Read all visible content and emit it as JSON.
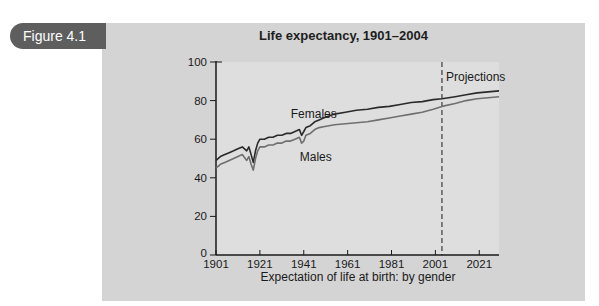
{
  "figure": {
    "label": "Figure 4.1",
    "colors": {
      "tab_bg": "#5e5e5e",
      "panel_bg": "#d4d4d4",
      "plot_bg": "#dedede",
      "females_line": "#2a2a2a",
      "males_line": "#6f6f6f",
      "axis": "#1a1a1a"
    }
  },
  "chart_data": {
    "type": "line",
    "title": "Life expectancy, 1901–2004",
    "xlabel": "Expectation of life at birth: by gender",
    "ylabel": "",
    "xlim": [
      1901,
      2030
    ],
    "ylim": [
      0,
      100
    ],
    "x_ticks": [
      "1901",
      "1921",
      "1941",
      "1961",
      "1981",
      "2001",
      "2021"
    ],
    "y_ticks": [
      "0",
      "20",
      "40",
      "60",
      "80",
      "100"
    ],
    "grid": false,
    "legend": "inline labels",
    "annotations": [
      {
        "text": "Projections",
        "x": 2004,
        "note": "dashed vertical line marks start of projections"
      },
      {
        "text": "Females",
        "x": 1941,
        "y": 73
      },
      {
        "text": "Males",
        "x": 1941,
        "y": 51
      }
    ],
    "projection_start": 2004,
    "series": [
      {
        "name": "Females",
        "x": [
          1901,
          1903,
          1905,
          1907,
          1909,
          1911,
          1913,
          1915,
          1916,
          1917,
          1918,
          1919,
          1920,
          1921,
          1923,
          1925,
          1927,
          1929,
          1931,
          1933,
          1935,
          1937,
          1939,
          1940,
          1941,
          1942,
          1944,
          1946,
          1948,
          1950,
          1955,
          1960,
          1965,
          1970,
          1975,
          1980,
          1985,
          1990,
          1995,
          2000,
          2004,
          2010,
          2015,
          2020,
          2025,
          2030
        ],
        "values": [
          49,
          51,
          52,
          53,
          54,
          55,
          56,
          54,
          56,
          52,
          48,
          54,
          58,
          60,
          60,
          61,
          61,
          62,
          62,
          63,
          63,
          64,
          65,
          62,
          64,
          66,
          67,
          69,
          70,
          71,
          73,
          74,
          75,
          75.5,
          76.5,
          77,
          78,
          79,
          79.5,
          80.5,
          81,
          82,
          83,
          84,
          84.5,
          85
        ]
      },
      {
        "name": "Males",
        "x": [
          1901,
          1903,
          1905,
          1907,
          1909,
          1911,
          1913,
          1915,
          1916,
          1917,
          1918,
          1919,
          1920,
          1921,
          1923,
          1925,
          1927,
          1929,
          1931,
          1933,
          1935,
          1937,
          1939,
          1940,
          1941,
          1942,
          1944,
          1946,
          1948,
          1950,
          1955,
          1960,
          1965,
          1970,
          1975,
          1980,
          1985,
          1990,
          1995,
          2000,
          2004,
          2010,
          2015,
          2020,
          2025,
          2030
        ],
        "values": [
          45,
          47,
          48,
          49,
          50,
          51,
          52,
          49,
          51,
          47,
          44,
          50,
          54,
          56,
          56,
          57,
          57,
          58,
          58,
          59,
          59,
          60,
          61,
          58,
          59,
          62,
          63,
          65,
          66,
          66.5,
          67.5,
          68,
          68.5,
          69,
          70,
          71,
          72,
          73,
          74,
          75.5,
          77,
          78.5,
          80,
          81,
          81.5,
          82
        ]
      }
    ]
  }
}
